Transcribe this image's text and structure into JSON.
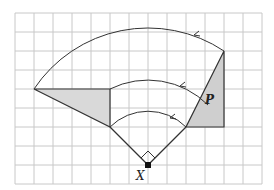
{
  "diagram": {
    "type": "rotation-on-grid",
    "grid": {
      "columns": 13,
      "rows": 9,
      "cell_px": 19,
      "origin_px": [
        15,
        13
      ],
      "line_color": "#c8c8c8"
    },
    "labels": {
      "center": "X",
      "shape": "P"
    },
    "colors": {
      "shade": "#d4d4d4",
      "stroke": "#333333"
    },
    "shapes": {
      "image_triangle": [
        [
          34,
          89
        ],
        [
          110,
          89
        ],
        [
          110,
          127
        ]
      ],
      "object_triangle_P": [
        [
          186,
          127
        ],
        [
          224,
          127
        ],
        [
          224,
          51
        ]
      ]
    },
    "center_point": [
      148,
      165
    ],
    "rotation": {
      "angle_deg": 90,
      "direction": "anticlockwise",
      "right_angle_marker": true
    }
  }
}
